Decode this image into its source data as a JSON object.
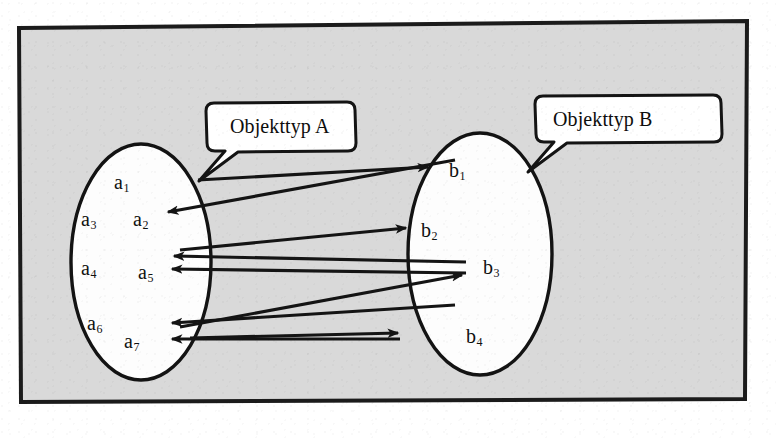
{
  "figure": {
    "frame": {
      "border_color": "#1c1c1c",
      "fill_color": "#d9d9d9"
    },
    "ink_color": "#111111",
    "set_fill_color": "#fefefe"
  },
  "callouts": [
    {
      "id": "callout-a",
      "label": "Objekttyp A"
    },
    {
      "id": "callout-b",
      "label": "Objekttyp B"
    }
  ],
  "sets": [
    {
      "id": "set-a",
      "name": "Objekttyp A",
      "elements": [
        {
          "id": "a1",
          "base": "a",
          "sub": "1"
        },
        {
          "id": "a3",
          "base": "a",
          "sub": "3"
        },
        {
          "id": "a2",
          "base": "a",
          "sub": "2"
        },
        {
          "id": "a4",
          "base": "a",
          "sub": "4"
        },
        {
          "id": "a5",
          "base": "a",
          "sub": "5"
        },
        {
          "id": "a6",
          "base": "a",
          "sub": "6"
        },
        {
          "id": "a7",
          "base": "a",
          "sub": "7"
        }
      ]
    },
    {
      "id": "set-b",
      "name": "Objekttyp B",
      "elements": [
        {
          "id": "b1",
          "base": "b",
          "sub": "1"
        },
        {
          "id": "b2",
          "base": "b",
          "sub": "2"
        },
        {
          "id": "b3",
          "base": "b",
          "sub": "3"
        },
        {
          "id": "b4",
          "base": "b",
          "sub": "4"
        }
      ]
    }
  ],
  "relations": [
    {
      "id": "rel-a1-b1",
      "from": "a1",
      "to": "b1",
      "direction": "a-to-b"
    },
    {
      "id": "rel-b1-a2",
      "from": "b1",
      "to": "a2",
      "direction": "b-to-a"
    },
    {
      "id": "rel-a5-b2",
      "from": "a5",
      "to": "b2",
      "direction": "a-to-b"
    },
    {
      "id": "rel-b3-a5-upper",
      "from": "b3",
      "to": "a5",
      "direction": "b-to-a"
    },
    {
      "id": "rel-b3-a5-lower",
      "from": "b3",
      "to": "a5",
      "direction": "b-to-a"
    },
    {
      "id": "rel-a7-b3",
      "from": "a7",
      "to": "b3",
      "direction": "a-to-b"
    },
    {
      "id": "rel-b4-a7",
      "from": "b4",
      "to": "a7",
      "direction": "b-to-a"
    }
  ]
}
